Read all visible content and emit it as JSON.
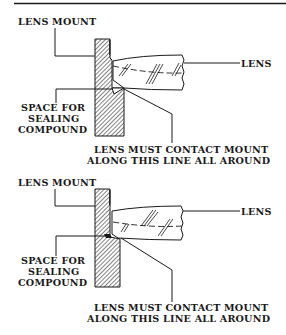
{
  "diagram": {
    "type": "technical-illustration",
    "colors": {
      "ink": "#1a1a1a",
      "background": "#ffffff"
    },
    "panels": [
      {
        "id": "top",
        "labels": {
          "mount": "LENS MOUNT",
          "lens": "LENS",
          "space_line1": "SPACE FOR",
          "space_line2": "SEALING",
          "space_line3": "COMPOUND",
          "contact_line1": "LENS MUST CONTACT MOUNT",
          "contact_line2": "ALONG THIS LINE ALL AROUND"
        }
      },
      {
        "id": "bottom",
        "labels": {
          "mount": "LENS MOUNT",
          "lens": "LENS",
          "space_line1": "SPACE FOR",
          "space_line2": "SEALING",
          "space_line3": "COMPOUND",
          "contact_line1": "LENS MUST CONTACT MOUNT",
          "contact_line2": "ALONG THIS LINE ALL AROUND"
        }
      }
    ]
  }
}
